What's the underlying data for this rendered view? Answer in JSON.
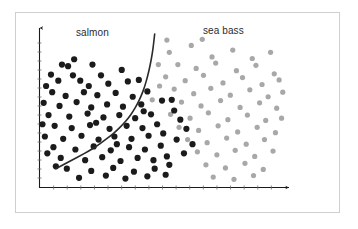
{
  "figure": {
    "title": "",
    "background_color": "#ffffff",
    "frame_color": "#cfcfcf"
  },
  "labels": {
    "salmon": "salmon",
    "sea_bass": "sea bass"
  },
  "axes": {
    "x_axis_name": "x-axis",
    "y_axis_name": "y-axis",
    "axis_color": "#1a1a1a",
    "has_arrowheads": true,
    "has_tick_marks": true,
    "x_tick_count": 17,
    "y_tick_count": 16,
    "x_label": "",
    "y_label": "",
    "x_tick_labels": [],
    "y_tick_labels": []
  },
  "boundary": {
    "name": "decision-boundary",
    "color": "#2a2a2a",
    "width": 1.6,
    "description": "nonlinear decision boundary separating salmon from sea bass"
  },
  "chart_data": {
    "type": "scatter",
    "title": "",
    "xlabel": "",
    "ylabel": "",
    "xlim": [
      0,
      100
    ],
    "ylim": [
      0,
      100
    ],
    "grid": false,
    "legend": "none",
    "annotations": [
      {
        "text": "salmon",
        "x": 23,
        "y": 95
      },
      {
        "text": "sea bass",
        "x": 73,
        "y": 96
      }
    ],
    "decision_boundary": {
      "color": "#2a2a2a",
      "points": [
        [
          47.0,
          100.0
        ],
        [
          46.6,
          94.0
        ],
        [
          46.0,
          87.0
        ],
        [
          45.2,
          80.0
        ],
        [
          44.2,
          73.0
        ],
        [
          43.0,
          66.0
        ],
        [
          41.6,
          60.0
        ],
        [
          40.0,
          54.5
        ],
        [
          38.2,
          49.5
        ],
        [
          36.2,
          45.0
        ],
        [
          34.0,
          41.0
        ],
        [
          31.5,
          37.0
        ],
        [
          29.0,
          33.5
        ],
        [
          26.0,
          30.0
        ],
        [
          23.0,
          26.5
        ],
        [
          20.0,
          23.5
        ],
        [
          16.5,
          20.5
        ],
        [
          13.0,
          17.5
        ],
        [
          9.5,
          14.5
        ],
        [
          6.5,
          12.0
        ]
      ],
      "x_pixel_hint": "starts near top at x=145px, ends at x=253px y=186px"
    },
    "series": [
      {
        "name": "salmon",
        "color": "#1b1b1b",
        "marker": "circle",
        "marker_size": 3.1,
        "points": [
          [
            14.0,
            83.5
          ],
          [
            9.0,
            80.0
          ],
          [
            11.5,
            79.0
          ],
          [
            4.5,
            73.5
          ],
          [
            13.5,
            73.0
          ],
          [
            21.5,
            80.0
          ],
          [
            25.0,
            73.0
          ],
          [
            33.5,
            76.5
          ],
          [
            2.5,
            66.0
          ],
          [
            7.5,
            69.5
          ],
          [
            16.5,
            69.5
          ],
          [
            20.0,
            66.0
          ],
          [
            28.0,
            67.5
          ],
          [
            36.0,
            69.0
          ],
          [
            40.5,
            70.0
          ],
          [
            5.0,
            62.0
          ],
          [
            10.5,
            59.5
          ],
          [
            18.0,
            62.0
          ],
          [
            23.5,
            60.0
          ],
          [
            31.0,
            61.5
          ],
          [
            38.0,
            59.0
          ],
          [
            44.0,
            62.5
          ],
          [
            1.5,
            55.0
          ],
          [
            8.0,
            53.0
          ],
          [
            15.0,
            55.5
          ],
          [
            21.0,
            52.0
          ],
          [
            27.5,
            54.0
          ],
          [
            34.0,
            52.5
          ],
          [
            41.5,
            54.0
          ],
          [
            3.5,
            47.0
          ],
          [
            12.0,
            46.0
          ],
          [
            19.5,
            48.0
          ],
          [
            26.0,
            45.5
          ],
          [
            32.5,
            47.0
          ],
          [
            39.0,
            45.0
          ],
          [
            45.5,
            47.5
          ],
          [
            6.0,
            40.0
          ],
          [
            13.0,
            38.5
          ],
          [
            20.5,
            40.5
          ],
          [
            28.5,
            38.0
          ],
          [
            35.5,
            40.0
          ],
          [
            42.0,
            38.5
          ],
          [
            48.0,
            41.0
          ],
          [
            2.0,
            33.0
          ],
          [
            9.5,
            31.5
          ],
          [
            17.0,
            33.5
          ],
          [
            24.0,
            31.0
          ],
          [
            30.5,
            33.0
          ],
          [
            37.5,
            31.5
          ],
          [
            44.5,
            33.5
          ],
          [
            50.5,
            35.0
          ],
          [
            5.5,
            26.0
          ],
          [
            14.5,
            24.5
          ],
          [
            22.0,
            26.5
          ],
          [
            29.0,
            24.0
          ],
          [
            36.5,
            26.0
          ],
          [
            43.0,
            24.5
          ],
          [
            49.5,
            27.0
          ],
          [
            8.5,
            19.0
          ],
          [
            18.5,
            17.5
          ],
          [
            25.5,
            19.5
          ],
          [
            33.0,
            17.0
          ],
          [
            40.0,
            19.0
          ],
          [
            46.5,
            17.5
          ],
          [
            52.0,
            20.0
          ],
          [
            11.0,
            12.0
          ],
          [
            21.0,
            10.5
          ],
          [
            30.0,
            12.5
          ],
          [
            38.5,
            10.0
          ],
          [
            47.0,
            12.0
          ],
          [
            53.0,
            14.5
          ],
          [
            16.0,
            6.0
          ],
          [
            27.0,
            7.5
          ],
          [
            35.0,
            5.5
          ],
          [
            44.0,
            7.0
          ],
          [
            51.5,
            8.0
          ],
          [
            55.0,
            50.0
          ],
          [
            57.5,
            44.0
          ],
          [
            60.0,
            38.0
          ],
          [
            56.0,
            31.0
          ],
          [
            62.5,
            28.0
          ],
          [
            59.0,
            22.0
          ],
          [
            54.0,
            57.0
          ],
          [
            1.0,
            41.0
          ],
          [
            3.0,
            22.0
          ],
          [
            6.5,
            13.5
          ],
          [
            23.0,
            42.0
          ],
          [
            31.5,
            28.0
          ],
          [
            42.5,
            49.5
          ],
          [
            50.0,
            56.5
          ]
        ]
      },
      {
        "name": "sea bass",
        "color": "#a8a8a8",
        "marker": "circle",
        "marker_size": 2.6,
        "points": [
          [
            53.0,
            88.0
          ],
          [
            62.0,
            92.5
          ],
          [
            70.5,
            85.0
          ],
          [
            79.0,
            89.5
          ],
          [
            87.0,
            84.0
          ],
          [
            94.5,
            88.0
          ],
          [
            56.5,
            80.0
          ],
          [
            64.0,
            77.5
          ],
          [
            72.0,
            81.0
          ],
          [
            80.5,
            76.0
          ],
          [
            88.5,
            79.5
          ],
          [
            96.0,
            74.0
          ],
          [
            51.5,
            72.0
          ],
          [
            59.5,
            69.5
          ],
          [
            67.0,
            73.0
          ],
          [
            75.0,
            68.0
          ],
          [
            83.0,
            71.5
          ],
          [
            91.0,
            67.0
          ],
          [
            98.0,
            70.0
          ],
          [
            55.0,
            64.0
          ],
          [
            63.0,
            61.0
          ],
          [
            70.0,
            64.5
          ],
          [
            78.0,
            60.0
          ],
          [
            86.0,
            63.5
          ],
          [
            93.5,
            59.0
          ],
          [
            58.0,
            55.5
          ],
          [
            66.0,
            53.0
          ],
          [
            74.0,
            56.5
          ],
          [
            82.0,
            52.0
          ],
          [
            90.0,
            55.0
          ],
          [
            97.0,
            51.5
          ],
          [
            53.5,
            47.5
          ],
          [
            61.5,
            45.0
          ],
          [
            69.0,
            48.5
          ],
          [
            77.0,
            44.0
          ],
          [
            85.0,
            47.0
          ],
          [
            92.5,
            43.5
          ],
          [
            57.0,
            39.0
          ],
          [
            65.0,
            37.0
          ],
          [
            73.0,
            40.0
          ],
          [
            81.0,
            36.0
          ],
          [
            89.0,
            39.0
          ],
          [
            96.5,
            35.5
          ],
          [
            60.5,
            31.0
          ],
          [
            68.5,
            29.0
          ],
          [
            76.5,
            32.0
          ],
          [
            84.5,
            28.0
          ],
          [
            92.0,
            31.0
          ],
          [
            64.5,
            23.0
          ],
          [
            72.5,
            21.0
          ],
          [
            80.0,
            24.0
          ],
          [
            88.0,
            20.0
          ],
          [
            95.5,
            23.5
          ],
          [
            68.0,
            14.5
          ],
          [
            76.0,
            12.5
          ],
          [
            84.0,
            15.5
          ],
          [
            91.5,
            11.5
          ],
          [
            71.0,
            6.5
          ],
          [
            79.5,
            5.0
          ],
          [
            87.5,
            7.5
          ],
          [
            52.0,
            96.0
          ],
          [
            66.5,
            96.5
          ],
          [
            99.0,
            45.0
          ],
          [
            99.5,
            62.0
          ],
          [
            49.0,
            66.0
          ],
          [
            48.5,
            80.0
          ],
          [
            46.0,
            57.0
          ]
        ]
      }
    ]
  }
}
